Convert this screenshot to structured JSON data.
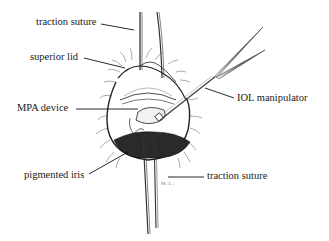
{
  "figure": {
    "type": "surgical illustration",
    "labels": {
      "traction_suture_top": "traction suture",
      "superior_lid": "superior lid",
      "mpa_device": "MPA device",
      "iol_manipulator": "IOL manipulator",
      "pigmented_iris": "pigmented iris",
      "traction_suture_bottom": "traction suture"
    },
    "signature": "M.L.",
    "colors": {
      "ink": "#1a1a1a",
      "iris_fill": "#2a2a2a",
      "background": "#ffffff"
    }
  }
}
